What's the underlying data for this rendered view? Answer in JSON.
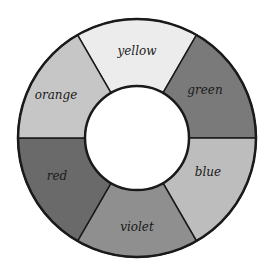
{
  "diagram": {
    "type": "color-wheel",
    "center": [
      137,
      138
    ],
    "outer_radius": 119,
    "inner_radius": 52,
    "segments": [
      {
        "label": "yellow",
        "start_deg": 240,
        "end_deg": 300,
        "fill": "#ececec",
        "label_pos": [
          137,
          55
        ]
      },
      {
        "label": "green",
        "start_deg": 300,
        "end_deg": 360,
        "fill": "#7a7a7a",
        "label_pos": [
          205,
          94
        ]
      },
      {
        "label": "blue",
        "start_deg": 0,
        "end_deg": 60,
        "fill": "#bdbdbd",
        "label_pos": [
          208,
          176
        ]
      },
      {
        "label": "violet",
        "start_deg": 60,
        "end_deg": 120,
        "fill": "#8f8f8f",
        "label_pos": [
          137,
          231
        ]
      },
      {
        "label": "red",
        "start_deg": 120,
        "end_deg": 180,
        "fill": "#6a6a6a",
        "label_pos": [
          57,
          180
        ]
      },
      {
        "label": "orange",
        "start_deg": 180,
        "end_deg": 240,
        "fill": "#c6c6c6",
        "label_pos": [
          56,
          99
        ]
      }
    ],
    "stroke": "#1a1a1a"
  }
}
